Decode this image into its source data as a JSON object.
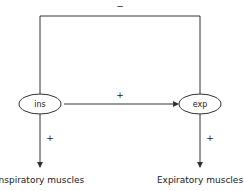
{
  "diagram": {
    "nodes": [
      {
        "id": "ins",
        "label": "ins"
      },
      {
        "id": "exp",
        "label": "exp"
      }
    ],
    "edges": [
      {
        "from": "exp",
        "to": "ins",
        "sign": "−",
        "route": "top-feedback"
      },
      {
        "from": "ins",
        "to": "exp",
        "sign": "+"
      },
      {
        "from": "ins",
        "to": "inspiratory_muscles",
        "sign": "+"
      },
      {
        "from": "exp",
        "to": "expiratory_muscles",
        "sign": "+"
      }
    ],
    "outputs": {
      "inspiratory": "Inspiratory muscles",
      "expiratory": "Expiratory muscles"
    },
    "colors": {
      "line": "#333333",
      "background": "#ffffff"
    }
  }
}
